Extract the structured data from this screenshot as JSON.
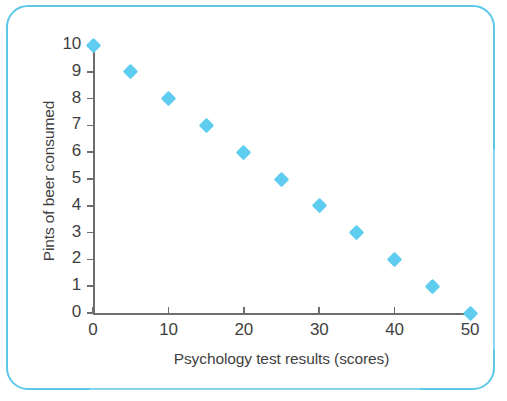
{
  "chart_data": {
    "type": "scatter",
    "title": "",
    "xlabel": "Psychology test results (scores)",
    "ylabel": "Pints of beer consumed",
    "xlim": [
      0,
      50
    ],
    "ylim": [
      0,
      10
    ],
    "xticks": [
      "0",
      "10",
      "20",
      "30",
      "40",
      "50"
    ],
    "xtick_values": [
      0,
      10,
      20,
      30,
      40,
      50
    ],
    "yticks": [
      "0",
      "1",
      "2",
      "3",
      "4",
      "5",
      "6",
      "7",
      "8",
      "9",
      "10"
    ],
    "ytick_values": [
      0,
      1,
      2,
      3,
      4,
      5,
      6,
      7,
      8,
      9,
      10
    ],
    "grid": false,
    "legend": false,
    "marker_shape": "diamond",
    "marker_color": "#5ecdf0",
    "axis_color": "#6e6e6e",
    "frame_color": "#5bc8e8",
    "series": [
      {
        "name": "Beer vs test score",
        "x": [
          0,
          5,
          10,
          15,
          20,
          25,
          30,
          35,
          40,
          45,
          50
        ],
        "y": [
          10,
          9,
          8,
          7,
          6,
          5,
          4,
          3,
          2,
          1,
          0
        ]
      }
    ]
  }
}
